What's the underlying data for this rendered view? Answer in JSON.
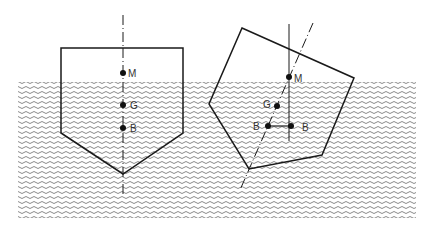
{
  "diagram": {
    "type": "ship-stability",
    "colors": {
      "line": "#1a1a1a",
      "water": "#8a8a8a",
      "background": "#ffffff"
    },
    "upright": {
      "labels": {
        "metacenter": "M",
        "gravity": "G",
        "buoyancy": "B"
      }
    },
    "heeled": {
      "labels": {
        "metacenter": "M",
        "gravity": "G",
        "buoyancy_original": "B",
        "buoyancy_shifted": "B"
      }
    }
  }
}
